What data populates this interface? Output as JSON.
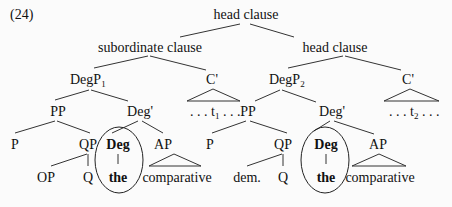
{
  "example_number": "(24)",
  "tree": {
    "root": {
      "label": "head clause"
    },
    "left_branch": {
      "label": "subordinate clause",
      "degp": {
        "label": "DegP",
        "subscript": "1"
      },
      "cbar": {
        "label": "C'",
        "content": ". . . t",
        "trace_subscript": "1",
        "trailing": " . . ."
      },
      "pp": {
        "label": "PP"
      },
      "p": {
        "label": "P"
      },
      "qp": {
        "label": "QP"
      },
      "op": {
        "label": "OP"
      },
      "q": {
        "label": "Q"
      },
      "degbar": {
        "label": "Deg'"
      },
      "deg": {
        "label": "Deg"
      },
      "the": {
        "label": "the"
      },
      "ap": {
        "label": "AP"
      },
      "comparative": {
        "label": "comparative"
      }
    },
    "right_branch": {
      "label": "head clause",
      "degp": {
        "label": "DegP",
        "subscript": "2"
      },
      "cbar": {
        "label": "C'",
        "content": ". . . t",
        "trace_subscript": "2",
        "trailing": " . . ."
      },
      "pp": {
        "label": "PP"
      },
      "p": {
        "label": "P"
      },
      "qp": {
        "label": "QP"
      },
      "dem": {
        "label": "dem."
      },
      "q": {
        "label": "Q"
      },
      "degbar": {
        "label": "Deg'"
      },
      "deg": {
        "label": "Deg"
      },
      "the": {
        "label": "the"
      },
      "ap": {
        "label": "AP"
      },
      "comparative": {
        "label": "comparative"
      }
    }
  }
}
